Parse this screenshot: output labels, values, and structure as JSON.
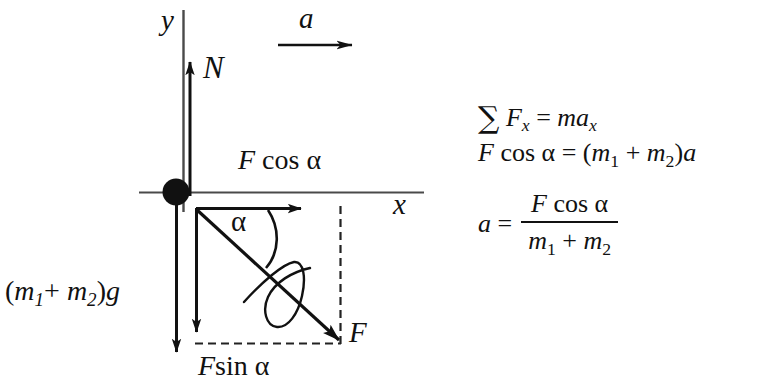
{
  "figure": {
    "type": "free-body-diagram",
    "axes": {
      "y_label": "y",
      "x_label": "x"
    },
    "vectors": [
      {
        "name": "normal-force",
        "label": "N",
        "direction": "up"
      },
      {
        "name": "acceleration",
        "label": "a",
        "direction": "right"
      },
      {
        "name": "force-x-component",
        "label_force": "F",
        "label_func": "cos",
        "label_angle": "α",
        "direction": "right"
      },
      {
        "name": "force-y-component",
        "label_force": "F",
        "label_func": "sin",
        "label_angle": "α",
        "direction": "down"
      },
      {
        "name": "applied-force",
        "label": "F",
        "direction": "down-right"
      },
      {
        "name": "weight",
        "label_prefix": "(",
        "label_m1": "m",
        "label_m1_sub": "1",
        "label_plus": "+ ",
        "label_m2": "m",
        "label_m2_sub": "2",
        "label_suffix": ")",
        "label_g": "g",
        "direction": "down"
      }
    ],
    "angle": {
      "label": "α"
    }
  },
  "labels": {
    "y": "y",
    "x": "x",
    "N": "N",
    "a": "a",
    "F": "F",
    "alpha": "α",
    "cos": "cos",
    "sin": "sin",
    "m": "m",
    "g": "g",
    "sub1": "1",
    "sub2": "2",
    "plus": "+",
    "paren_open": "(",
    "paren_close": ")",
    "sigma": "∑",
    "equals": "=",
    "F_sub_x": "x",
    "a_sub_x": "x"
  },
  "equations": {
    "line1": {
      "sigma": "∑",
      "F": "F",
      "F_sub": "x",
      "equals": "=",
      "m": "m",
      "a": "a",
      "a_sub": "x"
    },
    "line2": {
      "F": "F",
      "cos": "cos",
      "alpha": "α",
      "equals": "=",
      "paren_open": "(",
      "m1": "m",
      "m1_sub": "1",
      "plus": "+",
      "m2": "m",
      "m2_sub": "2",
      "paren_close": ")",
      "a": "a"
    },
    "line3": {
      "a": "a",
      "equals": "=",
      "numerator": {
        "F": "F",
        "cos": "cos",
        "alpha": "α"
      },
      "denominator": {
        "m1": "m",
        "m1_sub": "1",
        "plus": "+",
        "m2": "m",
        "m2_sub": "2"
      }
    }
  },
  "colors": {
    "ink": "#111111",
    "axis": "#3a3a3a",
    "background": "#ffffff",
    "dashed": "#222222"
  }
}
